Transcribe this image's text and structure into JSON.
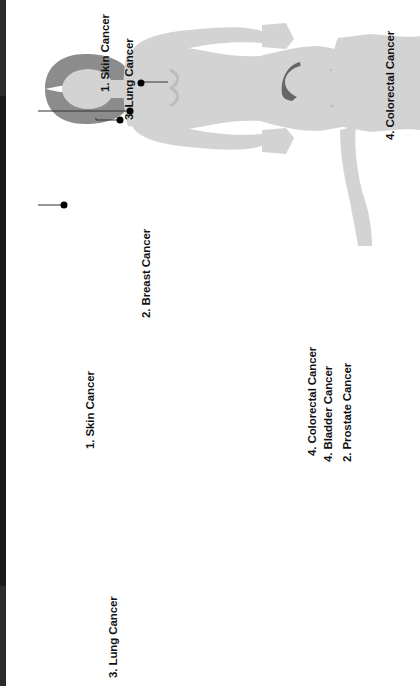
{
  "figures": [
    {
      "name": "female-figure",
      "labels": [
        {
          "id": "f-skin",
          "text": "1. Skin Cancer"
        },
        {
          "id": "f-lung",
          "text": "3. Lung Cancer"
        },
        {
          "id": "f-breast",
          "text": "2. Breast Cancer"
        },
        {
          "id": "f-colorectal",
          "text": "4. Colorectal Cancer"
        }
      ]
    },
    {
      "name": "male-figure",
      "labels": [
        {
          "id": "m-skin",
          "text": "1. Skin Cancer"
        },
        {
          "id": "m-lung",
          "text": "3. Lung Cancer"
        },
        {
          "id": "m-colorectal",
          "text": "4. Colorectal Cancer"
        },
        {
          "id": "m-bladder",
          "text": "4. Bladder Cancer"
        },
        {
          "id": "m-prostate",
          "text": "2. Prostate Cancer"
        }
      ]
    }
  ],
  "colors": {
    "body": "#d3d3d3",
    "body_shade": "#bdbdbd",
    "hair_female": "#8c8c8c",
    "hair_male": "#666666",
    "marker": "#000000",
    "leader_line": "#333333",
    "top_bar": "#2b2b2b"
  }
}
